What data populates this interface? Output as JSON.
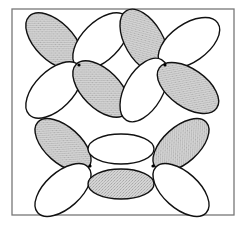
{
  "diagram": {
    "type": "orbital-lobes",
    "frame": {
      "x": 12,
      "y": 9,
      "width": 222,
      "height": 206,
      "stroke": "#777777"
    },
    "colors": {
      "shaded": "#c9c9c9",
      "unshaded": "#ffffff",
      "outline": "#111111",
      "dot": "#000000"
    },
    "groups": [
      {
        "name": "d-orbital-top-left",
        "center": [
          79,
          65
        ],
        "lobes": [
          {
            "cx": 54,
            "cy": 41,
            "rx": 35,
            "ry": 19,
            "rot": 45,
            "shaded": true
          },
          {
            "cx": 101,
            "cy": 41,
            "rx": 35,
            "ry": 19,
            "rot": -45,
            "shaded": false
          },
          {
            "cx": 54,
            "cy": 90,
            "rx": 35,
            "ry": 19,
            "rot": -45,
            "shaded": false
          },
          {
            "cx": 101,
            "cy": 89,
            "rx": 35,
            "ry": 19,
            "rot": 45,
            "shaded": true
          }
        ]
      },
      {
        "name": "d-orbital-top-right",
        "center": [
          165,
          65
        ],
        "lobes": [
          {
            "cx": 144,
            "cy": 41,
            "rx": 35,
            "ry": 19,
            "rot": 60,
            "shaded": true
          },
          {
            "cx": 189,
            "cy": 43,
            "rx": 35,
            "ry": 19,
            "rot": -35,
            "shaded": false
          },
          {
            "cx": 144,
            "cy": 90,
            "rx": 35,
            "ry": 19,
            "rot": -60,
            "shaded": false
          },
          {
            "cx": 188,
            "cy": 88,
            "rx": 35,
            "ry": 19,
            "rot": 35,
            "shaded": true
          }
        ]
      },
      {
        "name": "pi-system-bottom",
        "dots": [
          [
            90,
            166
          ],
          [
            153,
            166
          ]
        ],
        "lobes": [
          {
            "cx": 63,
            "cy": 145,
            "rx": 34,
            "ry": 18,
            "rot": 42,
            "shaded": true
          },
          {
            "cx": 63,
            "cy": 190,
            "rx": 34,
            "ry": 18,
            "rot": -42,
            "shaded": false
          },
          {
            "cx": 121,
            "cy": 149,
            "rx": 33,
            "ry": 15,
            "rot": 0,
            "shaded": false
          },
          {
            "cx": 121,
            "cy": 184,
            "rx": 33,
            "ry": 15,
            "rot": 0,
            "shaded": true
          },
          {
            "cx": 181,
            "cy": 145,
            "rx": 34,
            "ry": 18,
            "rot": -42,
            "shaded": true
          },
          {
            "cx": 181,
            "cy": 190,
            "rx": 34,
            "ry": 18,
            "rot": 42,
            "shaded": false
          }
        ]
      }
    ]
  }
}
